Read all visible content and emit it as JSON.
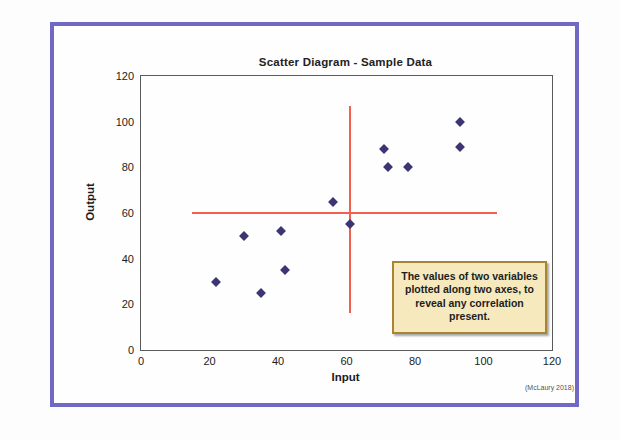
{
  "figure": {
    "number_label": "FIGURE 8.12",
    "accent_color": "#6f68c4"
  },
  "chart_data": {
    "type": "scatter",
    "title": "Scatter Diagram - Sample Data",
    "xlabel": "Input",
    "ylabel": "Output",
    "xlim": [
      0,
      120
    ],
    "ylim": [
      0,
      120
    ],
    "xticks": [
      0,
      20,
      40,
      60,
      80,
      100,
      120
    ],
    "yticks": [
      0,
      20,
      40,
      60,
      80,
      100,
      120
    ],
    "grid": false,
    "legend": false,
    "marker_color": "#3b3673",
    "marker_shape": "diamond",
    "points": [
      {
        "x": 22,
        "y": 30
      },
      {
        "x": 30,
        "y": 50
      },
      {
        "x": 35,
        "y": 25
      },
      {
        "x": 41,
        "y": 52
      },
      {
        "x": 42,
        "y": 35
      },
      {
        "x": 56,
        "y": 65
      },
      {
        "x": 61,
        "y": 55
      },
      {
        "x": 71,
        "y": 88
      },
      {
        "x": 72,
        "y": 80
      },
      {
        "x": 78,
        "y": 80
      },
      {
        "x": 93,
        "y": 100
      },
      {
        "x": 93,
        "y": 89
      }
    ],
    "reference_lines": [
      {
        "orientation": "horizontal",
        "y": 60,
        "x_start": 15,
        "x_end": 104,
        "color": "#f4604f"
      },
      {
        "orientation": "vertical",
        "x": 61,
        "y_start": 16,
        "y_end": 107,
        "color": "#f4604f"
      }
    ],
    "annotations": [
      {
        "name": "definition-callout",
        "text": "The values of two variables plotted along two axes, to reveal any correlation present.",
        "background": "#f6e9bd",
        "border_color": "#a8852f"
      }
    ],
    "attribution": "(McLaury 2018)"
  }
}
